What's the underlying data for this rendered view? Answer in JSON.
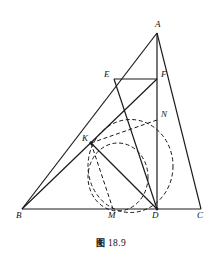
{
  "figure": {
    "caption_cjk": "图",
    "caption_number": "18.9",
    "stroke_color": "#1a1a1a",
    "dash_color": "#1a1a1a",
    "background": "#ffffff",
    "points": {
      "A": {
        "label": "A",
        "x": 157,
        "y": 33,
        "lx": 155,
        "ly": 20
      },
      "B": {
        "label": "B",
        "x": 22,
        "y": 209,
        "lx": 16,
        "ly": 211
      },
      "C": {
        "label": "C",
        "x": 201,
        "y": 209,
        "lx": 197,
        "ly": 211
      },
      "D": {
        "label": "D",
        "x": 157,
        "y": 209,
        "lx": 152,
        "ly": 211
      },
      "E": {
        "label": "E",
        "x": 114,
        "y": 79,
        "lx": 104,
        "ly": 70
      },
      "F": {
        "label": "F",
        "x": 157,
        "y": 79,
        "lx": 161,
        "ly": 70
      },
      "K": {
        "label": "K",
        "x": 91,
        "y": 143,
        "lx": 82,
        "ly": 134
      },
      "M": {
        "label": "M",
        "x": 113,
        "y": 209,
        "lx": 108,
        "ly": 211
      },
      "N": {
        "label": "N",
        "x": 157,
        "y": 120,
        "lx": 161,
        "ly": 110
      }
    },
    "solid_segments": [
      {
        "name": "side-ab",
        "from": "A",
        "to": "B"
      },
      {
        "name": "side-bc",
        "from": "B",
        "to": "C"
      },
      {
        "name": "side-ca",
        "from": "C",
        "to": "A"
      },
      {
        "name": "altitude-ad",
        "from": "A",
        "to": "D"
      },
      {
        "name": "segment-ef",
        "from": "E",
        "to": "F"
      },
      {
        "name": "segment-ed",
        "from": "E",
        "to": "D"
      },
      {
        "name": "segment-bf",
        "from": "B",
        "to": "F"
      },
      {
        "name": "segment-kd",
        "from": "K",
        "to": "D"
      }
    ],
    "dashed_circles": [
      {
        "name": "circle-kndm-large",
        "cx": 130.5,
        "cy": 166,
        "rx": 42.5,
        "ry": 46.5,
        "rotate": 0
      },
      {
        "name": "circle-kmd-small",
        "cx": 118,
        "cy": 177,
        "rx": 30,
        "ry": 34,
        "rotate": 0
      }
    ],
    "dashed_chords": [
      {
        "name": "chord-kn",
        "from": "K",
        "to": "N"
      },
      {
        "name": "chord-km",
        "from": "K",
        "to": "M"
      }
    ]
  }
}
